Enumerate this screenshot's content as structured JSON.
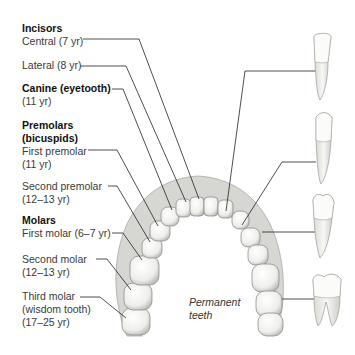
{
  "labels": {
    "incisors": {
      "heading": "Incisors",
      "central": "Central (7 yr)",
      "lateral": "Lateral (8 yr)"
    },
    "canine": {
      "heading": "Canine (eyetooth)",
      "age": "(11 yr)"
    },
    "premolars": {
      "heading1": "Premolars",
      "heading2": "(bicuspids)",
      "first": "First premolar",
      "first_age": "(11 yr)",
      "second": "Second premolar",
      "second_age": "(12–13 yr)"
    },
    "molars": {
      "heading": "Molars",
      "first": "First molar (6–7 yr)",
      "second": "Second molar",
      "second_age": "(12–13 yr)",
      "third": "Third molar",
      "third_sub": "(wisdom tooth)",
      "third_age": "(17–25 yr)"
    }
  },
  "annotation": {
    "line1": "Permanent",
    "line2": "teeth"
  },
  "side_teeth": [
    "incisor",
    "canine",
    "premolar",
    "molar"
  ],
  "colors": {
    "line": "#222222",
    "tooth": "#f4f4f2",
    "tooth_shade": "#c8c8c4",
    "gum": "#d9d9d6"
  }
}
